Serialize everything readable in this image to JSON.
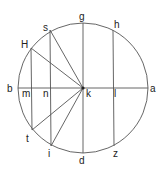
{
  "diagram": {
    "type": "geometric-circle-construction",
    "colors": {
      "stroke": "#555555",
      "label": "#222222",
      "background": "#ffffff"
    },
    "circle": {
      "center": "k",
      "cx": 83,
      "cy": 88,
      "r": 65
    },
    "points": {
      "g": {
        "label": "g",
        "x": 83,
        "y": 23
      },
      "d": {
        "label": "d",
        "x": 83,
        "y": 153
      },
      "b": {
        "label": "b",
        "x": 18,
        "y": 88
      },
      "a": {
        "label": "a",
        "x": 148,
        "y": 88
      },
      "k": {
        "label": "k",
        "x": 83,
        "y": 88
      },
      "H": {
        "label": "H",
        "x": 31,
        "y": 48
      },
      "s": {
        "label": "s",
        "x": 50,
        "y": 30
      },
      "h": {
        "label": "h",
        "x": 113,
        "y": 30
      },
      "m": {
        "label": "m",
        "x": 31,
        "y": 88
      },
      "n": {
        "label": "n",
        "x": 50,
        "y": 88
      },
      "l": {
        "label": "l",
        "x": 113,
        "y": 88
      },
      "t": {
        "label": "t",
        "x": 32,
        "y": 130
      },
      "i": {
        "label": "i",
        "x": 51,
        "y": 146
      },
      "z": {
        "label": "z",
        "x": 114,
        "y": 146
      }
    },
    "segments": [
      [
        "b",
        "a"
      ],
      [
        "g",
        "d"
      ],
      [
        "H",
        "t"
      ],
      [
        "s",
        "i"
      ],
      [
        "h",
        "z"
      ],
      [
        "k",
        "H"
      ],
      [
        "k",
        "s"
      ],
      [
        "k",
        "t"
      ],
      [
        "k",
        "i"
      ]
    ]
  }
}
